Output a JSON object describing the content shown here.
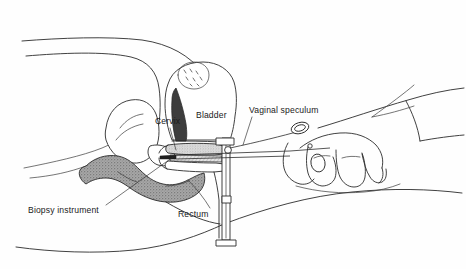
{
  "figure": {
    "background_color": "#fefefe",
    "line_color": "#2b2b2b",
    "text_color": "#1a1a1a",
    "shade_color": "#9a9a9a",
    "dark_fill_color": "#3d3d3d",
    "style": "black-and-white medical line drawing"
  },
  "labels": [
    {
      "id": "cervix",
      "text": "Cervix",
      "x": 155,
      "y": 124,
      "has_leader": true
    },
    {
      "id": "bladder",
      "text": "Bladder",
      "x": 196,
      "y": 118,
      "has_leader": false
    },
    {
      "id": "vaginal_speculum",
      "text": "Vaginal speculum",
      "x": 249,
      "y": 113,
      "has_leader": true
    },
    {
      "id": "biopsy_instrument",
      "text": "Biopsy instrument",
      "x": 28,
      "y": 213,
      "has_leader": true
    },
    {
      "id": "rectum",
      "text": "Rectum",
      "x": 178,
      "y": 217,
      "has_leader": false
    }
  ],
  "anatomy": [
    {
      "id": "abdomen-contour",
      "name": "abdominal wall outline",
      "shading": "none"
    },
    {
      "id": "thigh-contour",
      "name": "thigh and buttock outline",
      "shading": "none"
    },
    {
      "id": "uterus",
      "name": "uterus",
      "shading": "none"
    },
    {
      "id": "bladder-organ",
      "name": "bladder",
      "shading": "none"
    },
    {
      "id": "pubic-bone",
      "name": "pubic symphysis",
      "shading": "tickmarks"
    },
    {
      "id": "rectum-organ",
      "name": "rectum",
      "shading": "gray-stipple"
    },
    {
      "id": "vaginal-canal",
      "name": "vaginal canal",
      "shading": "none"
    }
  ],
  "instruments": [
    {
      "id": "speculum",
      "name": "vaginal speculum",
      "parts": [
        "upper blade",
        "lower blade",
        "frame post",
        "thumb screw",
        "base foot"
      ]
    },
    {
      "id": "biopsy-forceps",
      "name": "biopsy instrument",
      "parts": [
        "shaft",
        "ring handle",
        "jaw tip"
      ]
    }
  ],
  "hand": {
    "id": "clinician-hand",
    "name": "clinician hand and forearm",
    "parts": [
      "thumb",
      "index finger",
      "middle finger",
      "ring finger",
      "little finger",
      "forearm",
      "sleeve cuff"
    ]
  }
}
